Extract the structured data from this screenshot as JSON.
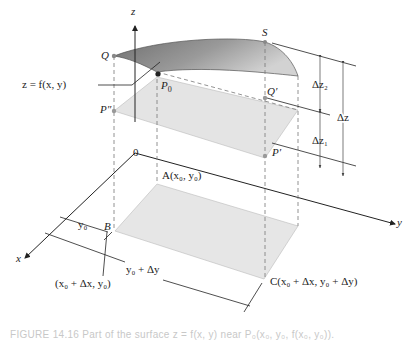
{
  "diagram": {
    "type": "3d-surface-increment",
    "axes": {
      "x": "x",
      "y": "y",
      "z": "z",
      "origin": "0"
    },
    "surface_label": "z = f(x, y)",
    "points": {
      "Q": "Q",
      "S": "S",
      "P0": "P",
      "P0_sub": "0",
      "P_double_prime": "P″",
      "Q_prime": "Q′",
      "P_prime": "P′",
      "A": "A(x₀, y₀)",
      "B": "B",
      "B_coords": "(x₀ + Δx, y₀)",
      "C": "C(x₀ + Δx, y₀ + Δy)"
    },
    "dimensions": {
      "dz2": "Δz₂",
      "dz1": "Δz₁",
      "dz": "Δz",
      "y0": "y₀",
      "y0_plus_dy": "y₀ + Δy"
    },
    "colors": {
      "surface_dark": "#7d7d7d",
      "surface_light": "#c9c9c9",
      "plane": "#e4e4e4",
      "line": "#333333",
      "dashed": "#777777"
    }
  },
  "caption": {
    "text": "FIGURE 14.16  Part of the surface z = f(x, y) near P₀(x₀, y₀, f(x₀, y₀))."
  }
}
